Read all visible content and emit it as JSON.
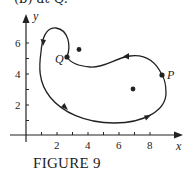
{
  "top_caption": "(b) at Q.",
  "caption": "FIGURE 9",
  "axes": {
    "x_label": "x",
    "y_label": "y",
    "x_ticks": [
      "2",
      "4",
      "6",
      "8"
    ],
    "y_ticks": [
      "2",
      "4",
      "6"
    ]
  },
  "points": {
    "P": {
      "label": "P",
      "x": 8.8,
      "y": 3.9
    },
    "Q": {
      "label": "Q",
      "x": 2.7,
      "y": 5.1
    }
  },
  "dots": [
    {
      "x": 3.4,
      "y": 5.6
    },
    {
      "x": 6.9,
      "y": 3.0
    }
  ],
  "colors": {
    "ink": "#222222",
    "background": "#ffffff"
  }
}
